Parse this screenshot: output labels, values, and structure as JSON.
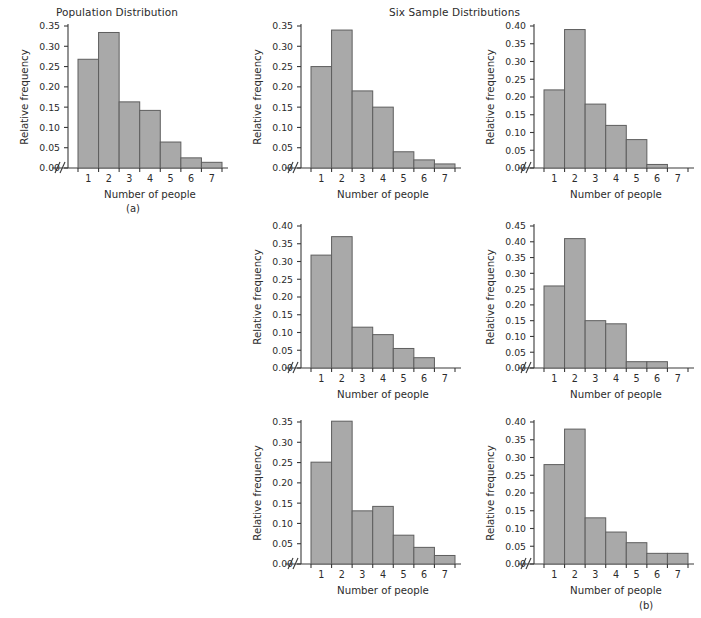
{
  "figure": {
    "titles": {
      "population": "Population Distribution",
      "samples": "Six Sample Distributions"
    },
    "captions": {
      "a": "(a)",
      "b": "(b)"
    },
    "axis": {
      "xlabel": "Number of people",
      "ylabel": "Relative frequency",
      "xticks": [
        "1",
        "2",
        "3",
        "4",
        "5",
        "6",
        "7"
      ],
      "break_symbol": "//"
    },
    "colors": {
      "bar_fill": "#a9a9a9",
      "bar_edge": "#5e5e5e",
      "axis": "#3a3a3a",
      "text": "#2b2b2b",
      "background": "#ffffff"
    }
  },
  "chart_data": [
    {
      "type": "bar",
      "id": "population",
      "title": "Population Distribution",
      "caption": "(a)",
      "xlabel": "Number of people",
      "ylabel": "Relative frequency",
      "categories": [
        "1",
        "2",
        "3",
        "4",
        "5",
        "6",
        "7"
      ],
      "values": [
        0.268,
        0.334,
        0.163,
        0.142,
        0.064,
        0.025,
        0.014
      ],
      "ylim": [
        0.0,
        0.35
      ],
      "ytick_step": 0.05,
      "yticks": [
        "0.00",
        "0.05",
        "0.10",
        "0.15",
        "0.20",
        "0.25",
        "0.30",
        "0.35"
      ],
      "grid": false,
      "legend": "none"
    },
    {
      "type": "bar",
      "id": "sample-1",
      "title": "",
      "xlabel": "Number of people",
      "ylabel": "Relative frequency",
      "categories": [
        "1",
        "2",
        "3",
        "4",
        "5",
        "6",
        "7"
      ],
      "values": [
        0.25,
        0.34,
        0.19,
        0.15,
        0.04,
        0.02,
        0.01
      ],
      "ylim": [
        0.0,
        0.35
      ],
      "ytick_step": 0.05,
      "yticks": [
        "0.00",
        "0.05",
        "0.10",
        "0.15",
        "0.20",
        "0.25",
        "0.30",
        "0.35"
      ],
      "grid": false,
      "legend": "none"
    },
    {
      "type": "bar",
      "id": "sample-2",
      "title": "",
      "xlabel": "Number of people",
      "ylabel": "Relative frequency",
      "categories": [
        "1",
        "2",
        "3",
        "4",
        "5",
        "6",
        "7"
      ],
      "values": [
        0.22,
        0.39,
        0.18,
        0.12,
        0.08,
        0.01,
        0.0
      ],
      "ylim": [
        0.0,
        0.4
      ],
      "ytick_step": 0.05,
      "yticks": [
        "0.00",
        "0.05",
        "0.10",
        "0.15",
        "0.20",
        "0.25",
        "0.30",
        "0.35",
        "0.40"
      ],
      "grid": false,
      "legend": "none"
    },
    {
      "type": "bar",
      "id": "sample-3",
      "title": "",
      "xlabel": "Number of people",
      "ylabel": "Relative frequency",
      "categories": [
        "1",
        "2",
        "3",
        "4",
        "5",
        "6",
        "7"
      ],
      "values": [
        0.318,
        0.37,
        0.115,
        0.094,
        0.055,
        0.029,
        0.0
      ],
      "ylim": [
        0.0,
        0.4
      ],
      "ytick_step": 0.05,
      "yticks": [
        "0.00",
        "0.05",
        "0.10",
        "0.15",
        "0.20",
        "0.25",
        "0.30",
        "0.35",
        "0.40"
      ],
      "grid": false,
      "legend": "none"
    },
    {
      "type": "bar",
      "id": "sample-4",
      "title": "",
      "xlabel": "Number of people",
      "ylabel": "Relative frequency",
      "categories": [
        "1",
        "2",
        "3",
        "4",
        "5",
        "6",
        "7"
      ],
      "values": [
        0.26,
        0.41,
        0.15,
        0.14,
        0.02,
        0.02,
        0.0
      ],
      "ylim": [
        0.0,
        0.45
      ],
      "ytick_step": 0.05,
      "yticks": [
        "0.00",
        "0.05",
        "0.10",
        "0.15",
        "0.20",
        "0.25",
        "0.30",
        "0.35",
        "0.40",
        "0.45"
      ],
      "grid": false,
      "legend": "none"
    },
    {
      "type": "bar",
      "id": "sample-5",
      "title": "",
      "caption": "(b)",
      "xlabel": "Number of people",
      "ylabel": "Relative frequency",
      "categories": [
        "1",
        "2",
        "3",
        "4",
        "5",
        "6",
        "7"
      ],
      "values": [
        0.251,
        0.352,
        0.131,
        0.142,
        0.071,
        0.041,
        0.021
      ],
      "ylim": [
        0.0,
        0.35
      ],
      "ytick_step": 0.05,
      "yticks": [
        "0.00",
        "0.05",
        "0.10",
        "0.15",
        "0.20",
        "0.25",
        "0.30",
        "0.35"
      ],
      "grid": false,
      "legend": "none"
    },
    {
      "type": "bar",
      "id": "sample-6",
      "title": "",
      "xlabel": "Number of people",
      "ylabel": "Relative frequency",
      "categories": [
        "1",
        "2",
        "3",
        "4",
        "5",
        "6",
        "7"
      ],
      "values": [
        0.28,
        0.38,
        0.13,
        0.09,
        0.06,
        0.03,
        0.03
      ],
      "ylim": [
        0.0,
        0.4
      ],
      "ytick_step": 0.05,
      "yticks": [
        "0.00",
        "0.05",
        "0.10",
        "0.15",
        "0.20",
        "0.25",
        "0.30",
        "0.35",
        "0.40"
      ],
      "grid": false,
      "legend": "none"
    }
  ]
}
